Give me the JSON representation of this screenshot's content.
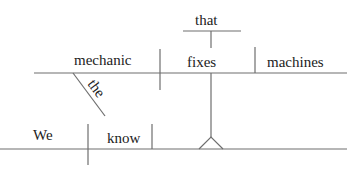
{
  "sentence": "We know that the mechanic fixes machines",
  "colors": {
    "line": "#6e6e6e",
    "text": "#222222",
    "background": "#ffffff"
  },
  "main_clause": {
    "subject": "We",
    "verb": "know"
  },
  "noun_clause": {
    "connector": "that",
    "subject": "mechanic",
    "subject_modifier": "the",
    "verb": "fixes",
    "direct_object": "machines"
  }
}
